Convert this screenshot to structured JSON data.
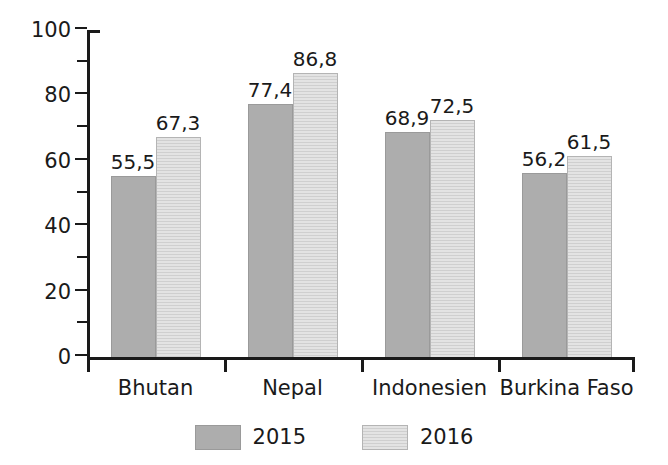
{
  "chart_data": {
    "type": "bar",
    "title": "",
    "subtitle": "",
    "xlabel": "",
    "ylabel": "",
    "ylim": [
      0,
      100
    ],
    "y_major_step": 20,
    "y_minor_step": 10,
    "grid": false,
    "legend_position": "bottom",
    "decimal_separator": ",",
    "categories": [
      "Bhutan",
      "Nepal",
      "Indonesien",
      "Burkina Faso"
    ],
    "y_tick_labels": [
      "0",
      "20",
      "40",
      "60",
      "80",
      "100"
    ],
    "y_tick_values": [
      0,
      20,
      40,
      60,
      80,
      100
    ],
    "y_minor_tick_values": [
      10,
      30,
      50,
      70,
      90
    ],
    "series": [
      {
        "name": "2015",
        "color": "#adadad",
        "values": [
          55.5,
          77.4,
          68.9,
          56.2
        ],
        "labels": [
          "55,5",
          "77,4",
          "68,9",
          "56,2"
        ]
      },
      {
        "name": "2016",
        "color": "#e3e3e3",
        "values": [
          67.3,
          86.8,
          72.5,
          61.5
        ],
        "labels": [
          "67,3",
          "86,8",
          "72,5",
          "61,5"
        ]
      }
    ]
  },
  "legend": {
    "items": [
      {
        "label": "2015"
      },
      {
        "label": "2016"
      }
    ]
  }
}
